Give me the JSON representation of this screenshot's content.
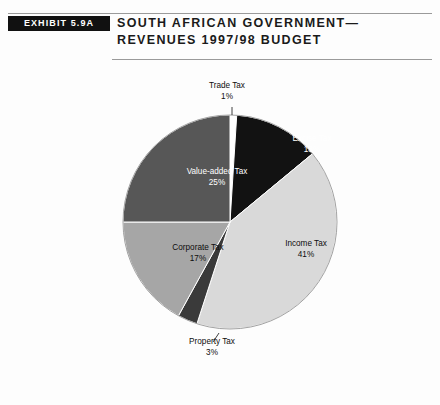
{
  "header": {
    "exhibit_label": "EXHIBIT 5.9A",
    "title_line1": "South African Government—",
    "title_line2": "Revenues 1997/98 Budget"
  },
  "chart_data": {
    "type": "pie",
    "xlabel": "",
    "ylabel": "",
    "legend": "none",
    "grid": false,
    "units": "percent",
    "start_angle_deg": 0,
    "direction": "clockwise",
    "categories": [
      "Trade Tax",
      "Excise Tax",
      "Income Tax",
      "Property Tax",
      "Corporate Tax",
      "Value-added Tax"
    ],
    "values": [
      1,
      13,
      41,
      3,
      17,
      25
    ],
    "slices": [
      {
        "label": "Trade Tax",
        "value": 1,
        "value_text": "1%",
        "color": "#ffffff",
        "label_color": "#0d0d0d",
        "label_placement": "outside"
      },
      {
        "label": "Excise Tax",
        "value": 13,
        "value_text": "13%",
        "color": "#121212",
        "label_color": "#ffffff",
        "label_placement": "inside"
      },
      {
        "label": "Income Tax",
        "value": 41,
        "value_text": "41%",
        "color": "#d9d9d9",
        "label_color": "#0d0d0d",
        "label_placement": "inside"
      },
      {
        "label": "Property Tax",
        "value": 3,
        "value_text": "3%",
        "color": "#3a3a3a",
        "label_color": "#0d0d0d",
        "label_placement": "outside"
      },
      {
        "label": "Corporate Tax",
        "value": 17,
        "value_text": "17%",
        "color": "#a6a6a6",
        "label_color": "#0d0d0d",
        "label_placement": "inside"
      },
      {
        "label": "Value-added Tax",
        "value": 25,
        "value_text": "25%",
        "color": "#575757",
        "label_color": "#ffffff",
        "label_placement": "inside"
      }
    ]
  }
}
